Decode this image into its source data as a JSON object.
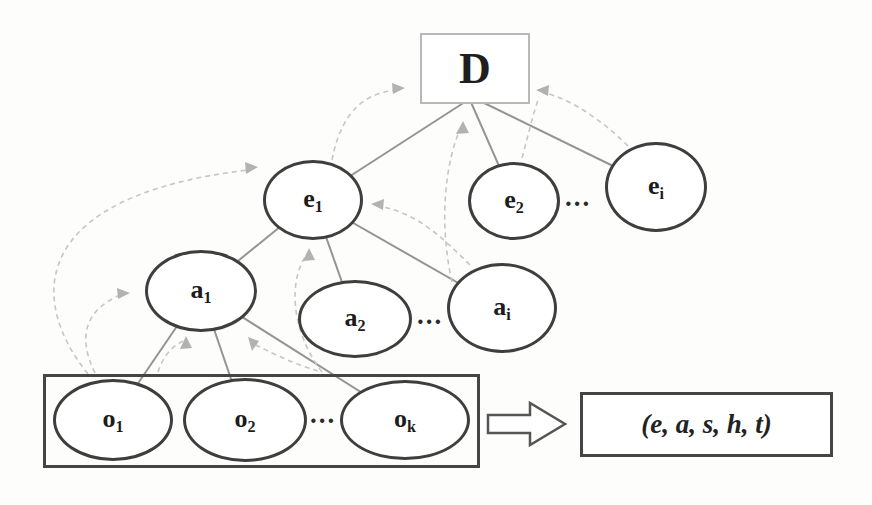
{
  "diagram": {
    "root": {
      "label": "D"
    },
    "e_layer": {
      "nodes": [
        {
          "base": "e",
          "sub": "1"
        },
        {
          "base": "e",
          "sub": "2"
        },
        {
          "base": "e",
          "sub": "i"
        }
      ],
      "ellipsis": "..."
    },
    "a_layer": {
      "nodes": [
        {
          "base": "a",
          "sub": "1"
        },
        {
          "base": "a",
          "sub": "2"
        },
        {
          "base": "a",
          "sub": "i"
        }
      ],
      "ellipsis": "..."
    },
    "o_layer": {
      "nodes": [
        {
          "base": "o",
          "sub": "1"
        },
        {
          "base": "o",
          "sub": "2"
        },
        {
          "base": "o",
          "sub": "k"
        }
      ],
      "ellipsis": "..."
    },
    "output_box": {
      "label": "(e, a, s, h, t)"
    },
    "colors": {
      "node_border": "#3e3e3e",
      "solid_edge": "#949494",
      "dashed_edge": "#c6c6c6",
      "arrowhead": "#b2b2b2",
      "root_box_border": "#b8b8b8",
      "container_border": "#454545",
      "text": "#1c1c1c",
      "background": "#fdfdfc"
    }
  }
}
